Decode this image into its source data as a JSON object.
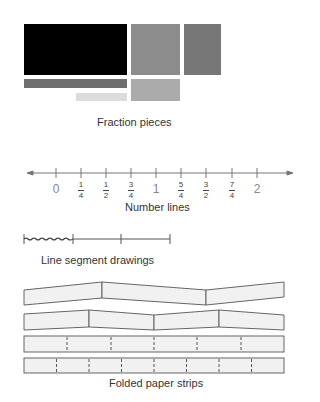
{
  "fraction_pieces": {
    "caption": "Fraction pieces",
    "pieces": [
      {
        "name": "whole-piece",
        "x": 24,
        "y": 24,
        "w": 103,
        "h": 51,
        "color": "#000000"
      },
      {
        "name": "half-piece",
        "x": 131,
        "y": 24,
        "w": 49,
        "h": 51,
        "color": "#8c8c8c"
      },
      {
        "name": "third-piece",
        "x": 184,
        "y": 24,
        "w": 37,
        "h": 51,
        "color": "#777777"
      },
      {
        "name": "bar-piece",
        "x": 24,
        "y": 79,
        "w": 103,
        "h": 9,
        "color": "#6f6f6f"
      },
      {
        "name": "small-bar-piece",
        "x": 76,
        "y": 93,
        "w": 51,
        "h": 8,
        "color": "#dcdcdc"
      },
      {
        "name": "quarter-piece",
        "x": 131,
        "y": 79,
        "w": 49,
        "h": 22,
        "color": "#ababab"
      }
    ]
  },
  "number_line": {
    "caption": "Number lines",
    "labels": [
      {
        "type": "whole",
        "text": "0",
        "x": 56
      },
      {
        "type": "fraction",
        "num": "1",
        "den": "4",
        "x": 81
      },
      {
        "type": "fraction",
        "num": "1",
        "den": "2",
        "x": 106
      },
      {
        "type": "fraction",
        "num": "3",
        "den": "4",
        "x": 131
      },
      {
        "type": "whole",
        "text": "1",
        "x": 156
      },
      {
        "type": "fraction",
        "num": "5",
        "den": "4",
        "x": 181
      },
      {
        "type": "fraction",
        "num": "3",
        "den": "2",
        "x": 206
      },
      {
        "type": "fraction",
        "num": "7",
        "den": "4",
        "x": 232
      },
      {
        "type": "whole",
        "text": "2",
        "x": 257
      }
    ]
  },
  "line_segment": {
    "caption": "Line segment drawings"
  },
  "paper_strips": {
    "caption": "Folded paper strips",
    "strip3_parts": 6,
    "strip4_parts": 8
  }
}
